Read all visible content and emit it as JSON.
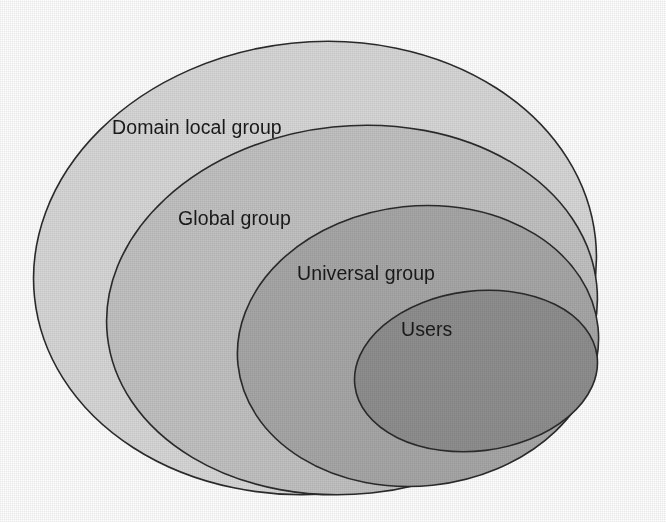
{
  "diagram": {
    "background_color": "#ffffff",
    "outline_color": "#2b2b2b",
    "label_color": "#1a1a1a",
    "tangent_point": {
      "x": 598,
      "y": 386
    },
    "levels": [
      {
        "id": "domain-local-group",
        "label": "Domain local group",
        "fill": "#d8d8d8",
        "depth": 1,
        "label_x": 112,
        "label_y": 134,
        "ellipse": {
          "cx": 315,
          "cy": 268,
          "rx": 282,
          "ry": 226,
          "rotate": -6
        }
      },
      {
        "id": "global-group",
        "label": "Global group",
        "fill": "#c2c2c2",
        "depth": 2,
        "label_x": 178,
        "label_y": 225,
        "ellipse": {
          "cx": 352,
          "cy": 310,
          "rx": 246,
          "ry": 184,
          "rotate": -6
        }
      },
      {
        "id": "universal-group",
        "label": "Universal group",
        "fill": "#a8a8a8",
        "depth": 3,
        "label_x": 297,
        "label_y": 280,
        "ellipse": {
          "cx": 418,
          "cy": 346,
          "rx": 181,
          "ry": 140,
          "rotate": -6
        }
      },
      {
        "id": "users",
        "label": "Users",
        "fill": "#8f8f8f",
        "depth": 4,
        "label_x": 401,
        "label_y": 336,
        "ellipse": {
          "cx": 476,
          "cy": 371,
          "rx": 122,
          "ry": 80,
          "rotate": -7
        }
      }
    ]
  }
}
